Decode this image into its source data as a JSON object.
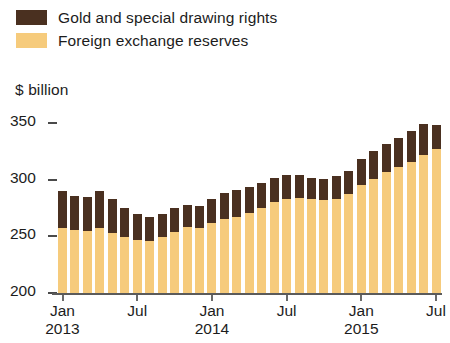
{
  "legend": {
    "items": [
      {
        "label": "Gold and special drawing rights",
        "color": "#4a3020",
        "key": "gold"
      },
      {
        "label": "Foreign exchange reserves",
        "color": "#f6cb7c",
        "key": "fx"
      }
    ]
  },
  "axis_title": "$ billion",
  "chart_data": {
    "type": "bar",
    "stacked": true,
    "title": "",
    "subtitle": "",
    "xlabel": "",
    "ylabel": "$ billion",
    "ylim": [
      200,
      360
    ],
    "yticks": [
      200,
      250,
      300,
      350
    ],
    "ytick_labels": [
      "200",
      "250",
      "300",
      "350"
    ],
    "grid": false,
    "legend_position": "top-left",
    "x_tick_labels": [
      {
        "month": "Jan",
        "year": "2013",
        "index": 0
      },
      {
        "month": "Jul",
        "year": "",
        "index": 6
      },
      {
        "month": "Jan",
        "year": "2014",
        "index": 12
      },
      {
        "month": "Jul",
        "year": "",
        "index": 18
      },
      {
        "month": "Jan",
        "year": "2015",
        "index": 24
      },
      {
        "month": "Jul",
        "year": "",
        "index": 30
      }
    ],
    "categories": [
      "Jan 2013",
      "Feb 2013",
      "Mar 2013",
      "Apr 2013",
      "May 2013",
      "Jun 2013",
      "Jul 2013",
      "Aug 2013",
      "Sep 2013",
      "Oct 2013",
      "Nov 2013",
      "Dec 2013",
      "Jan 2014",
      "Feb 2014",
      "Mar 2014",
      "Apr 2014",
      "May 2014",
      "Jun 2014",
      "Jul 2014",
      "Aug 2014",
      "Sep 2014",
      "Oct 2014",
      "Nov 2014",
      "Dec 2014",
      "Jan 2015",
      "Feb 2015",
      "Mar 2015",
      "Apr 2015",
      "May 2015",
      "Jun 2015",
      "Jul 2015"
    ],
    "series": [
      {
        "name": "Foreign exchange reserves",
        "color": "#f6cb7c",
        "values": [
          258,
          257,
          256,
          258,
          254,
          250,
          248,
          247,
          250,
          255,
          259,
          258,
          263,
          266,
          268,
          272,
          276,
          281,
          284,
          285,
          284,
          283,
          284,
          288,
          296,
          302,
          308,
          312,
          317,
          323,
          328
        ]
      },
      {
        "name": "Gold and special drawing rights",
        "color": "#4a3020",
        "values": [
          33,
          30,
          30,
          33,
          30,
          26,
          23,
          21,
          21,
          21,
          20,
          20,
          21,
          23,
          24,
          23,
          22,
          22,
          21,
          20,
          19,
          19,
          20,
          21,
          23,
          24,
          25,
          26,
          27,
          27,
          21
        ]
      }
    ],
    "totals": [
      291,
      287,
      286,
      291,
      284,
      276,
      271,
      268,
      271,
      276,
      279,
      278,
      284,
      289,
      292,
      295,
      298,
      303,
      305,
      305,
      303,
      302,
      304,
      309,
      319,
      326,
      333,
      338,
      344,
      350,
      349
    ]
  }
}
